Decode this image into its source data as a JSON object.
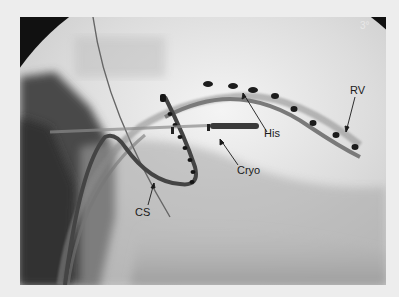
{
  "image": {
    "type": "fluoroscopy",
    "angle_label": "3°",
    "annotations": [
      {
        "id": "his",
        "label": "His"
      },
      {
        "id": "rv",
        "label": "RV"
      },
      {
        "id": "cryo",
        "label": "Cryo"
      },
      {
        "id": "cs",
        "label": "CS"
      }
    ]
  },
  "colors": {
    "page_background": "#ededed",
    "mask": "#111111",
    "label": "#1a1a1a"
  }
}
